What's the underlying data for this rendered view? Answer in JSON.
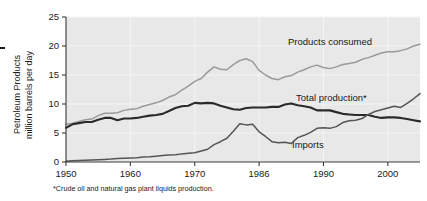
{
  "chart_data": {
    "type": "line",
    "title": "",
    "subtitle": "",
    "xlabel": "",
    "ylabel": "Petroleum Products million barrels per day",
    "ylabel_line1": "Petroleum Products",
    "ylabel_line2": "million barrels per day",
    "xlim": [
      1950,
      2005
    ],
    "ylim": [
      0,
      25
    ],
    "grid": true,
    "legend_position": "inline-annotations",
    "y_ticks": [
      "0",
      "5",
      "10",
      "15",
      "20",
      "25"
    ],
    "y_tick_values": [
      0,
      5,
      10,
      15,
      20,
      25
    ],
    "x_ticks": [
      "1950",
      "1960",
      "1970",
      "1986",
      "1990",
      "2000"
    ],
    "x_tick_values": [
      1950,
      1960,
      1970,
      1980,
      1990,
      2000
    ],
    "footnote": "*Crude oil and natural gas plant liquids production.",
    "annotations": [
      {
        "label": "Products consumed",
        "series": "products_consumed"
      },
      {
        "label": "Total production*",
        "series": "total_production"
      },
      {
        "label": "Imports",
        "series": "imports"
      }
    ],
    "series": [
      {
        "name": "Products consumed",
        "color": "#9a9a9a",
        "width": 1.5,
        "x": [
          1950,
          1951,
          1952,
          1953,
          1954,
          1955,
          1956,
          1957,
          1958,
          1959,
          1960,
          1961,
          1962,
          1963,
          1964,
          1965,
          1966,
          1967,
          1968,
          1969,
          1970,
          1971,
          1972,
          1973,
          1974,
          1975,
          1976,
          1977,
          1978,
          1979,
          1980,
          1981,
          1982,
          1983,
          1984,
          1985,
          1986,
          1987,
          1988,
          1989,
          1990,
          1991,
          1992,
          1993,
          1994,
          1995,
          1996,
          1997,
          1998,
          1999,
          2000,
          2001,
          2002,
          2003,
          2004,
          2005
        ],
        "values": [
          6.5,
          6.7,
          7.0,
          7.3,
          7.4,
          8.0,
          8.4,
          8.4,
          8.5,
          8.9,
          9.1,
          9.2,
          9.6,
          9.9,
          10.2,
          10.6,
          11.2,
          11.6,
          12.4,
          13.1,
          13.9,
          14.4,
          15.5,
          16.4,
          16.0,
          15.9,
          16.8,
          17.5,
          17.8,
          17.3,
          15.8,
          15.0,
          14.4,
          14.2,
          14.7,
          14.9,
          15.5,
          15.9,
          16.4,
          16.7,
          16.3,
          16.1,
          16.4,
          16.8,
          17.0,
          17.2,
          17.7,
          18.0,
          18.4,
          18.8,
          19.0,
          19.0,
          19.2,
          19.5,
          20.0,
          20.3
        ]
      },
      {
        "name": "Total production*",
        "color": "#2a2a2a",
        "width": 2.1,
        "x": [
          1950,
          1951,
          1952,
          1953,
          1954,
          1955,
          1956,
          1957,
          1958,
          1959,
          1960,
          1961,
          1962,
          1963,
          1964,
          1965,
          1966,
          1967,
          1968,
          1969,
          1970,
          1971,
          1972,
          1973,
          1974,
          1975,
          1976,
          1977,
          1978,
          1979,
          1980,
          1981,
          1982,
          1983,
          1984,
          1985,
          1986,
          1987,
          1988,
          1989,
          1990,
          1991,
          1992,
          1993,
          1994,
          1995,
          1996,
          1997,
          1998,
          1999,
          2000,
          2001,
          2002,
          2003,
          2004,
          2005
        ],
        "values": [
          5.9,
          6.5,
          6.7,
          6.9,
          6.9,
          7.3,
          7.6,
          7.6,
          7.2,
          7.5,
          7.5,
          7.6,
          7.8,
          8.0,
          8.1,
          8.3,
          8.8,
          9.3,
          9.6,
          9.7,
          10.2,
          10.1,
          10.2,
          10.1,
          9.7,
          9.4,
          9.1,
          9.0,
          9.3,
          9.4,
          9.4,
          9.4,
          9.5,
          9.5,
          9.9,
          10.1,
          9.8,
          9.6,
          9.4,
          8.9,
          8.9,
          8.9,
          8.6,
          8.3,
          8.2,
          8.1,
          8.1,
          8.1,
          7.8,
          7.6,
          7.7,
          7.7,
          7.6,
          7.4,
          7.2,
          7.0
        ]
      },
      {
        "name": "Imports",
        "color": "#555555",
        "width": 1.5,
        "x": [
          1950,
          1951,
          1952,
          1953,
          1954,
          1955,
          1956,
          1957,
          1958,
          1959,
          1960,
          1961,
          1962,
          1963,
          1964,
          1965,
          1966,
          1967,
          1968,
          1969,
          1970,
          1971,
          1972,
          1973,
          1974,
          1975,
          1976,
          1977,
          1978,
          1979,
          1980,
          1981,
          1982,
          1983,
          1984,
          1985,
          1986,
          1987,
          1988,
          1989,
          1990,
          1991,
          1992,
          1993,
          1994,
          1995,
          1996,
          1997,
          1998,
          1999,
          2000,
          2001,
          2002,
          2003,
          2004,
          2005
        ],
        "values": [
          0.15,
          0.2,
          0.25,
          0.3,
          0.35,
          0.4,
          0.45,
          0.5,
          0.6,
          0.65,
          0.7,
          0.75,
          0.85,
          0.9,
          1.0,
          1.1,
          1.2,
          1.25,
          1.4,
          1.5,
          1.6,
          1.9,
          2.2,
          3.0,
          3.5,
          4.1,
          5.3,
          6.6,
          6.4,
          6.5,
          5.2,
          4.4,
          3.5,
          3.3,
          3.4,
          3.2,
          4.2,
          4.6,
          5.1,
          5.8,
          5.9,
          5.8,
          6.1,
          6.8,
          7.1,
          7.2,
          7.5,
          8.2,
          8.7,
          9.0,
          9.3,
          9.6,
          9.4,
          10.1,
          10.9,
          11.8
        ]
      }
    ]
  },
  "figure": {
    "corner_mark": "•"
  }
}
